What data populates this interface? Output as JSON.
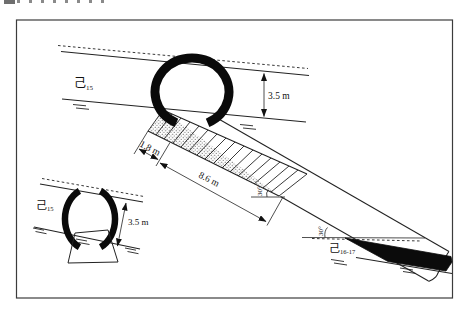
{
  "diagram": {
    "seam_upper": {
      "base": "己",
      "sub": "15"
    },
    "seam_lower": {
      "base": "己",
      "sub": "16-17"
    },
    "inset_seam": {
      "base": "己",
      "sub": "15"
    },
    "dimensions": {
      "seam_thickness_main": "3.5 m",
      "seam_thickness_inset": "3.5 m",
      "chute_width": "1.8 m",
      "incline_length": "8.6 m",
      "incline_angle": "30°",
      "seam_dip_angle": "30°"
    }
  }
}
